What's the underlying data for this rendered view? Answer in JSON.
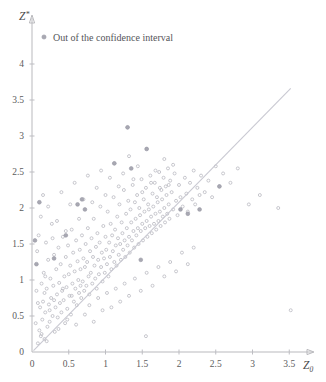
{
  "chart_data": {
    "type": "scatter",
    "title": "",
    "xlabel": "Z0",
    "ylabel": "Z*",
    "xlabel_base": "Z",
    "xlabel_sub": "0",
    "ylabel_base": "Z",
    "ylabel_sup": "*",
    "xlim": [
      0,
      3.8
    ],
    "ylim": [
      0,
      4.35
    ],
    "xticks": [
      0,
      0.5,
      1,
      1.5,
      2,
      2.5,
      3,
      3.5
    ],
    "xtick_labels": [
      "0",
      "0.5",
      "1",
      "1.5",
      "2",
      "2.5",
      "3",
      "3.5"
    ],
    "yticks": [
      0,
      0.5,
      1,
      1.5,
      2,
      2.5,
      3,
      3.5,
      4
    ],
    "ytick_labels": [
      "0",
      "0.5",
      "1",
      "1.5",
      "2",
      "2.5",
      "3",
      "3.5",
      "4"
    ],
    "grid": false,
    "legend_position": "top-left",
    "legend": [
      {
        "label": "Out of the confidence interval",
        "marker": "filled-circle",
        "color": "#a8a8b2"
      }
    ],
    "reference_line": {
      "name": "identity-line",
      "x": [
        0.02,
        3.52
      ],
      "y": [
        0.02,
        3.66
      ],
      "color": "#c9c9d2"
    },
    "series": [
      {
        "name": "bootstrap-replicates",
        "marker": "open-circle",
        "color": "#b5b5bd",
        "points": [
          [
            0.08,
            0.12
          ],
          [
            0.1,
            0.3
          ],
          [
            0.11,
            0.62
          ],
          [
            0.12,
            0.22
          ],
          [
            0.13,
            0.95
          ],
          [
            0.14,
            0.45
          ],
          [
            0.15,
            0.7
          ],
          [
            0.16,
            1.1
          ],
          [
            0.17,
            0.18
          ],
          [
            0.18,
            0.55
          ],
          [
            0.19,
            1.52
          ],
          [
            0.2,
            0.88
          ],
          [
            0.21,
            0.35
          ],
          [
            0.22,
            1.28
          ],
          [
            0.23,
            0.66
          ],
          [
            0.24,
            0.42
          ],
          [
            0.25,
            1.02
          ],
          [
            0.26,
            0.75
          ],
          [
            0.27,
            1.78
          ],
          [
            0.28,
            0.5
          ],
          [
            0.29,
            0.92
          ],
          [
            0.3,
            1.35
          ],
          [
            0.31,
            0.28
          ],
          [
            0.32,
            0.62
          ],
          [
            0.33,
            1.15
          ],
          [
            0.34,
            0.8
          ],
          [
            0.35,
            0.48
          ],
          [
            0.36,
            1.45
          ],
          [
            0.37,
            0.96
          ],
          [
            0.38,
            0.68
          ],
          [
            0.39,
            1.22
          ],
          [
            0.4,
            0.55
          ],
          [
            0.41,
            0.85
          ],
          [
            0.42,
            1.6
          ],
          [
            0.43,
            0.72
          ],
          [
            0.44,
            1.05
          ],
          [
            0.45,
            0.4
          ],
          [
            0.46,
            1.32
          ],
          [
            0.47,
            0.9
          ],
          [
            0.48,
            0.6
          ],
          [
            0.49,
            1.48
          ],
          [
            0.5,
            1.08
          ],
          [
            0.51,
            0.78
          ],
          [
            0.52,
            1.2
          ],
          [
            0.53,
            0.52
          ],
          [
            0.54,
            1.7
          ],
          [
            0.55,
            0.95
          ],
          [
            0.56,
            1.38
          ],
          [
            0.57,
            0.7
          ],
          [
            0.58,
            1.12
          ],
          [
            0.59,
            0.88
          ],
          [
            0.6,
            1.55
          ],
          [
            0.61,
            0.65
          ],
          [
            0.62,
            1.26
          ],
          [
            0.63,
            1.0
          ],
          [
            0.64,
            0.82
          ],
          [
            0.65,
            1.42
          ],
          [
            0.66,
            1.15
          ],
          [
            0.67,
            0.75
          ],
          [
            0.68,
            1.62
          ],
          [
            0.69,
            0.98
          ],
          [
            0.7,
            1.3
          ],
          [
            0.71,
            0.85
          ],
          [
            0.72,
            1.18
          ],
          [
            0.73,
            1.5
          ],
          [
            0.74,
            0.92
          ],
          [
            0.75,
            1.25
          ],
          [
            0.76,
            1.72
          ],
          [
            0.77,
            1.05
          ],
          [
            0.78,
            0.8
          ],
          [
            0.79,
            1.4
          ],
          [
            0.8,
            1.1
          ],
          [
            0.81,
            1.58
          ],
          [
            0.82,
            0.95
          ],
          [
            0.83,
            1.32
          ],
          [
            0.84,
            1.85
          ],
          [
            0.85,
            1.2
          ],
          [
            0.86,
            1.02
          ],
          [
            0.87,
            1.46
          ],
          [
            0.88,
            0.88
          ],
          [
            0.89,
            1.65
          ],
          [
            0.9,
            1.28
          ],
          [
            0.91,
            1.08
          ],
          [
            0.92,
            1.52
          ],
          [
            0.93,
            2.02
          ],
          [
            0.94,
            1.18
          ],
          [
            0.95,
            1.38
          ],
          [
            0.96,
            0.98
          ],
          [
            0.97,
            1.75
          ],
          [
            0.98,
            1.3
          ],
          [
            0.99,
            1.1
          ],
          [
            1.0,
            1.6
          ],
          [
            1.01,
            1.42
          ],
          [
            1.02,
            1.22
          ],
          [
            1.03,
            1.95
          ],
          [
            1.04,
            1.05
          ],
          [
            1.05,
            1.52
          ],
          [
            1.06,
            1.32
          ],
          [
            1.07,
            1.78
          ],
          [
            1.08,
            1.15
          ],
          [
            1.09,
            1.62
          ],
          [
            1.1,
            1.4
          ],
          [
            1.11,
            2.15
          ],
          [
            1.12,
            1.25
          ],
          [
            1.13,
            1.7
          ],
          [
            1.14,
            1.48
          ],
          [
            1.15,
            1.2
          ],
          [
            1.16,
            1.88
          ],
          [
            1.17,
            1.58
          ],
          [
            1.18,
            1.35
          ],
          [
            1.19,
            2.05
          ],
          [
            1.2,
            1.5
          ],
          [
            1.21,
            1.28
          ],
          [
            1.22,
            1.8
          ],
          [
            1.23,
            1.65
          ],
          [
            1.24,
            1.42
          ],
          [
            1.25,
            2.25
          ],
          [
            1.26,
            1.55
          ],
          [
            1.27,
            1.32
          ],
          [
            1.28,
            1.92
          ],
          [
            1.29,
            1.72
          ],
          [
            1.3,
            1.48
          ],
          [
            1.31,
            2.1
          ],
          [
            1.32,
            1.6
          ],
          [
            1.33,
            1.38
          ],
          [
            1.34,
            1.98
          ],
          [
            1.35,
            1.8
          ],
          [
            1.36,
            1.55
          ],
          [
            1.37,
            2.32
          ],
          [
            1.38,
            1.68
          ],
          [
            1.39,
            1.45
          ],
          [
            1.4,
            2.08
          ],
          [
            1.41,
            1.85
          ],
          [
            1.42,
            1.62
          ],
          [
            1.43,
            2.18
          ],
          [
            1.44,
            1.72
          ],
          [
            1.45,
            1.5
          ],
          [
            1.46,
            2.0
          ],
          [
            1.47,
            1.9
          ],
          [
            1.48,
            1.68
          ],
          [
            1.49,
            2.4
          ],
          [
            1.5,
            1.78
          ],
          [
            1.51,
            1.55
          ],
          [
            1.52,
            2.12
          ],
          [
            1.53,
            1.95
          ],
          [
            1.54,
            1.72
          ],
          [
            1.55,
            2.28
          ],
          [
            1.56,
            1.82
          ],
          [
            1.57,
            1.6
          ],
          [
            1.58,
            2.05
          ],
          [
            1.59,
            1.98
          ],
          [
            1.6,
            1.75
          ],
          [
            1.61,
            2.45
          ],
          [
            1.62,
            1.88
          ],
          [
            1.63,
            1.65
          ],
          [
            1.64,
            2.2
          ],
          [
            1.65,
            2.02
          ],
          [
            1.66,
            1.78
          ],
          [
            1.67,
            2.35
          ],
          [
            1.68,
            1.92
          ],
          [
            1.69,
            1.7
          ],
          [
            1.7,
            2.15
          ],
          [
            1.71,
            2.08
          ],
          [
            1.72,
            1.82
          ],
          [
            1.73,
            2.5
          ],
          [
            1.74,
            1.95
          ],
          [
            1.75,
            1.75
          ],
          [
            1.76,
            2.25
          ],
          [
            1.77,
            2.12
          ],
          [
            1.78,
            1.88
          ],
          [
            1.79,
            2.42
          ],
          [
            1.8,
            2.0
          ],
          [
            1.81,
            1.8
          ],
          [
            1.82,
            2.3
          ],
          [
            1.83,
            2.18
          ],
          [
            1.84,
            1.92
          ],
          [
            1.85,
            2.55
          ],
          [
            1.86,
            2.05
          ],
          [
            1.87,
            1.85
          ],
          [
            1.88,
            2.38
          ],
          [
            1.9,
            2.22
          ],
          [
            1.92,
            1.98
          ],
          [
            1.94,
            2.48
          ],
          [
            1.96,
            2.1
          ],
          [
            1.98,
            1.9
          ],
          [
            2.0,
            2.32
          ],
          [
            2.02,
            2.15
          ],
          [
            2.05,
            2.02
          ],
          [
            2.08,
            2.42
          ],
          [
            2.1,
            2.2
          ],
          [
            2.12,
            1.95
          ],
          [
            2.15,
            2.35
          ],
          [
            2.18,
            2.12
          ],
          [
            2.2,
            2.52
          ],
          [
            2.22,
            2.05
          ],
          [
            2.25,
            2.28
          ],
          [
            2.28,
            2.18
          ],
          [
            2.3,
            2.45
          ],
          [
            2.35,
            2.22
          ],
          [
            2.4,
            2.38
          ],
          [
            2.45,
            2.15
          ],
          [
            2.5,
            2.58
          ],
          [
            2.55,
            2.3
          ],
          [
            2.6,
            2.48
          ],
          [
            2.7,
            2.35
          ],
          [
            2.8,
            2.55
          ],
          [
            2.95,
            2.05
          ],
          [
            3.1,
            2.18
          ],
          [
            3.35,
            2.0
          ],
          [
            3.52,
            0.58
          ],
          [
            0.06,
            0.85
          ],
          [
            0.07,
            1.4
          ],
          [
            0.09,
            1.62
          ],
          [
            0.12,
            1.88
          ],
          [
            0.15,
            2.18
          ],
          [
            0.18,
            1.05
          ],
          [
            0.22,
            2.02
          ],
          [
            0.28,
            1.58
          ],
          [
            0.34,
            1.82
          ],
          [
            0.4,
            2.22
          ],
          [
            0.46,
            1.68
          ],
          [
            0.52,
            2.05
          ],
          [
            0.58,
            2.35
          ],
          [
            0.64,
            1.85
          ],
          [
            0.7,
            2.12
          ],
          [
            0.76,
            2.45
          ],
          [
            0.82,
            2.08
          ],
          [
            0.88,
            2.28
          ],
          [
            0.94,
            2.52
          ],
          [
            1.0,
            2.18
          ],
          [
            1.06,
            2.42
          ],
          [
            1.12,
            2.62
          ],
          [
            1.18,
            2.3
          ],
          [
            1.24,
            2.48
          ],
          [
            1.3,
            3.12
          ],
          [
            1.32,
            2.72
          ],
          [
            1.38,
            2.4
          ],
          [
            1.44,
            2.58
          ],
          [
            1.5,
            2.22
          ],
          [
            1.56,
            2.82
          ],
          [
            1.62,
            2.35
          ],
          [
            1.68,
            2.52
          ],
          [
            1.74,
            2.28
          ],
          [
            1.8,
            2.68
          ],
          [
            1.86,
            2.32
          ],
          [
            1.92,
            2.6
          ],
          [
            0.05,
            0.4
          ],
          [
            0.08,
            0.68
          ],
          [
            0.13,
            0.25
          ],
          [
            0.17,
            0.82
          ],
          [
            0.2,
            0.15
          ],
          [
            0.24,
            0.58
          ],
          [
            0.3,
            0.72
          ],
          [
            0.36,
            0.32
          ],
          [
            0.42,
            0.88
          ],
          [
            0.48,
            0.45
          ],
          [
            0.54,
            0.78
          ],
          [
            0.6,
            0.38
          ],
          [
            0.66,
            0.92
          ],
          [
            0.72,
            0.52
          ],
          [
            0.78,
            0.65
          ],
          [
            0.84,
            0.42
          ],
          [
            0.9,
            0.75
          ],
          [
            0.96,
            0.58
          ],
          [
            1.02,
            0.82
          ],
          [
            1.08,
            0.62
          ],
          [
            1.14,
            0.88
          ],
          [
            1.2,
            0.7
          ],
          [
            1.26,
            0.95
          ],
          [
            1.32,
            0.78
          ],
          [
            1.4,
            1.02
          ],
          [
            1.48,
            0.85
          ],
          [
            1.56,
            1.1
          ],
          [
            1.64,
            0.92
          ],
          [
            1.72,
            1.18
          ],
          [
            1.8,
            1.05
          ],
          [
            1.88,
            1.25
          ],
          [
            1.96,
            1.12
          ],
          [
            2.04,
            1.38
          ],
          [
            2.12,
            1.22
          ],
          [
            2.2,
            1.45
          ],
          [
            1.55,
            0.22
          ]
        ]
      },
      {
        "name": "out-of-confidence-interval",
        "marker": "filled-circle",
        "color": "#a8a8b2",
        "points": [
          [
            0.04,
            1.55
          ],
          [
            0.06,
            1.22
          ],
          [
            0.1,
            2.08
          ],
          [
            0.62,
            2.05
          ],
          [
            0.68,
            2.12
          ],
          [
            0.72,
            1.98
          ],
          [
            1.3,
            3.12
          ],
          [
            1.35,
            2.55
          ],
          [
            1.56,
            2.82
          ],
          [
            2.02,
            1.98
          ],
          [
            2.12,
            1.92
          ],
          [
            2.28,
            1.98
          ],
          [
            0.3,
            1.3
          ],
          [
            0.46,
            1.62
          ],
          [
            1.12,
            2.62
          ],
          [
            1.48,
            1.28
          ],
          [
            2.55,
            2.3
          ]
        ]
      }
    ]
  },
  "legend": {
    "entry_label": "Out of the confidence interval"
  },
  "axes": {
    "y_title": "Z*",
    "x_title": "Z0"
  }
}
